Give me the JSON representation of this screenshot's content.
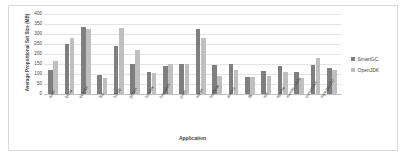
{
  "chart_data": {
    "type": "bar",
    "title": "",
    "xlabel": "Application",
    "ylabel": "Average Proportional Set Size (MB)",
    "ylim": [
      0,
      400
    ],
    "ytick_step": 50,
    "yticks": [
      "0",
      "50",
      "100",
      "150",
      "200",
      "250",
      "300",
      "350",
      "400"
    ],
    "grid": true,
    "legend_position": "right",
    "categories": [
      "antlr",
      "bloat",
      "eclipse",
      "fop",
      "h2/db",
      "jython",
      "luindex",
      "lusearch",
      "pmd",
      "xalan",
      "sunflow",
      "avrora",
      "fft",
      "sor",
      "sparse",
      "monte_carlo",
      "compress",
      "mpegaudio"
    ],
    "series": [
      {
        "name": "SmartGC",
        "color": "#7f7f7f",
        "values": [
          118,
          248,
          336,
          93,
          238,
          150,
          108,
          140,
          148,
          325,
          145,
          148,
          85,
          115,
          140,
          110,
          145,
          128
        ]
      },
      {
        "name": "OpenJDK",
        "color": "#bfbfbf",
        "values": [
          165,
          280,
          325,
          78,
          330,
          220,
          105,
          152,
          152,
          280,
          90,
          118,
          85,
          88,
          110,
          80,
          180,
          120
        ]
      }
    ]
  },
  "legend": {
    "entries": [
      {
        "label": "SmartGC"
      },
      {
        "label": "OpenJDK"
      }
    ]
  }
}
